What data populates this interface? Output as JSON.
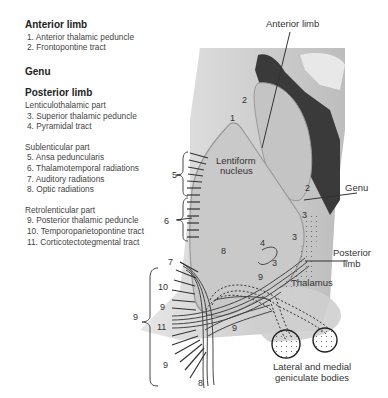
{
  "legend": {
    "anterior_limb": {
      "heading": "Anterior limb",
      "items": [
        "1. Anterior thalamic peduncle",
        "2. Frontopontine tract"
      ]
    },
    "genu": {
      "heading": "Genu"
    },
    "posterior_limb": {
      "heading": "Posterior limb",
      "groups": [
        {
          "title": "Lenticulothalamic part",
          "items": [
            "3. Superior thalamic peduncle",
            "4. Pyramidal tract"
          ]
        },
        {
          "title": "Sublenticular part",
          "items": [
            "5. Ansa peduncularis",
            "6. Thalamotemporal radiations",
            "7. Auditory radiations",
            "8. Optic radiations"
          ]
        },
        {
          "title": "Retrolenticular part",
          "items": [
            "9. Posterior thalamic peduncle",
            "10. Temporoparietopontine tract",
            "11. Corticotectotegmental tract"
          ]
        }
      ]
    }
  },
  "diagram": {
    "labels": {
      "anterior_limb": "Anterior limb",
      "lentiform_1": "Lentiform",
      "lentiform_2": "nucleus",
      "genu": "Genu",
      "posterior_limb_1": "Posterior",
      "posterior_limb_2": "limb",
      "thalamus": "Thalamus",
      "geniculate_1": "Lateral and medial",
      "geniculate_2": "geniculate bodies"
    },
    "numbers": {
      "n1": "1",
      "n2a": "2",
      "n2b": "2",
      "n3a": "3",
      "n3b": "3",
      "n3c": "3",
      "n4": "4",
      "n5": "5",
      "n6": "6",
      "n7": "7",
      "n8a": "8",
      "n8b": "8",
      "n9a": "9",
      "n9b": "9",
      "n9c": "9",
      "n9d": "9",
      "n9e": "9",
      "n9f": "9",
      "n10": "10",
      "n11": "11"
    },
    "colors": {
      "background_tissue": "#d4d4d4",
      "nucleus_fill": "#c8c8c8",
      "ventricle": "#3a3a3a",
      "outline": "#999999"
    }
  }
}
